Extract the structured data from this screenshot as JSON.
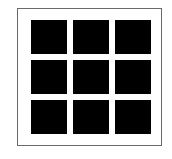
{
  "icon": {
    "name": "grid-3x3-icon",
    "rows": 3,
    "columns": 3,
    "cells": [
      {
        "row": 1,
        "col": 1
      },
      {
        "row": 1,
        "col": 2
      },
      {
        "row": 1,
        "col": 3
      },
      {
        "row": 2,
        "col": 1
      },
      {
        "row": 2,
        "col": 2
      },
      {
        "row": 2,
        "col": 3
      },
      {
        "row": 3,
        "col": 1
      },
      {
        "row": 3,
        "col": 2
      },
      {
        "row": 3,
        "col": 3
      }
    ],
    "colors": {
      "cell": "#000000",
      "border": "#6a6a6a",
      "background": "#ffffff"
    }
  }
}
